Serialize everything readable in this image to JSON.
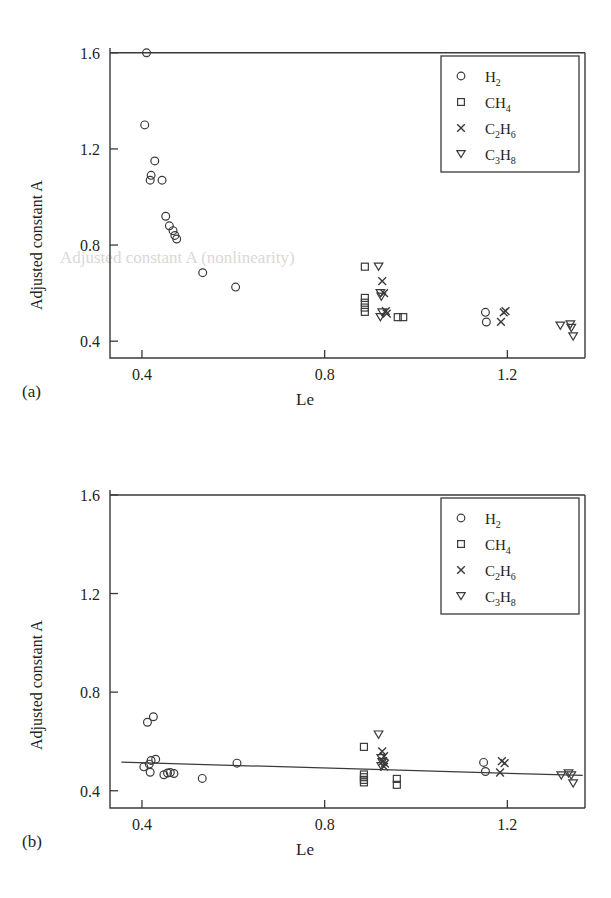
{
  "figure": {
    "panels": [
      {
        "tag": "(a)",
        "xlabel": "Le",
        "ylabel": "Adjusted constant A",
        "xticks": [
          "0.4",
          "0.8",
          "1.2"
        ],
        "yticks": [
          "1.6",
          "1.2",
          "0.8",
          "0.4"
        ]
      },
      {
        "tag": "(b)",
        "xlabel": "Le",
        "ylabel": "Adjusted constant A",
        "xticks": [
          "0.4",
          "0.8",
          "1.2"
        ],
        "yticks": [
          "1.6",
          "1.2",
          "0.8",
          "0.4"
        ]
      }
    ],
    "legend": [
      {
        "marker": "circle-marker",
        "base": "H",
        "sub1": "",
        "mid": "",
        "sub2": "2"
      },
      {
        "marker": "square-marker",
        "base": "CH",
        "sub1": "",
        "mid": "",
        "sub2": "4"
      },
      {
        "marker": "cross-marker",
        "base": "C",
        "sub1": "2",
        "mid": "H",
        "sub2": "6"
      },
      {
        "marker": "triangle-marker",
        "base": "C",
        "sub1": "3",
        "mid": "H",
        "sub2": "8"
      }
    ],
    "colors": {
      "ink": "#231f20",
      "axis": "#3a3a3a",
      "marker": "#3a3a3a",
      "background": "#ffffff"
    },
    "bleed_text": "Adjusted constant A (nonlinearity)"
  },
  "chart_data": [
    {
      "type": "scatter",
      "title": "",
      "panel": "(a)",
      "xlabel": "Le",
      "ylabel": "Adjusted constant A",
      "xlim": [
        0.33,
        1.37
      ],
      "ylim": [
        0.33,
        1.62
      ],
      "xticks": [
        0.4,
        0.8,
        1.2
      ],
      "yticks": [
        0.4,
        0.8,
        1.2,
        1.6
      ],
      "grid": false,
      "legend_position": "top-right",
      "series": [
        {
          "name": "H2",
          "marker": "circle",
          "points": [
            [
              0.41,
              1.6
            ],
            [
              0.406,
              1.3
            ],
            [
              0.428,
              1.15
            ],
            [
              0.42,
              1.09
            ],
            [
              0.418,
              1.07
            ],
            [
              0.444,
              1.07
            ],
            [
              0.452,
              0.92
            ],
            [
              0.46,
              0.88
            ],
            [
              0.468,
              0.86
            ],
            [
              0.472,
              0.84
            ],
            [
              0.476,
              0.825
            ],
            [
              0.533,
              0.685
            ],
            [
              0.605,
              0.625
            ],
            [
              1.152,
              0.52
            ],
            [
              1.154,
              0.48
            ]
          ]
        },
        {
          "name": "CH4",
          "marker": "square",
          "points": [
            [
              0.888,
              0.71
            ],
            [
              0.888,
              0.58
            ],
            [
              0.888,
              0.56
            ],
            [
              0.888,
              0.54
            ],
            [
              0.888,
              0.522
            ],
            [
              0.96,
              0.5
            ],
            [
              0.972,
              0.5
            ]
          ]
        },
        {
          "name": "C2H6",
          "marker": "cross",
          "points": [
            [
              0.926,
              0.65
            ],
            [
              0.93,
              0.6
            ],
            [
              0.934,
              0.525
            ],
            [
              0.936,
              0.515
            ],
            [
              1.196,
              0.525
            ],
            [
              1.192,
              0.52
            ],
            [
              1.186,
              0.48
            ]
          ]
        },
        {
          "name": "C3H8",
          "marker": "triangle-down",
          "points": [
            [
              0.918,
              0.71
            ],
            [
              0.922,
              0.6
            ],
            [
              0.924,
              0.585
            ],
            [
              0.926,
              0.52
            ],
            [
              0.922,
              0.5
            ],
            [
              1.316,
              0.465
            ],
            [
              1.338,
              0.47
            ],
            [
              1.34,
              0.455
            ],
            [
              1.344,
              0.42
            ]
          ]
        }
      ]
    },
    {
      "type": "scatter",
      "title": "",
      "panel": "(b)",
      "xlabel": "Le",
      "ylabel": "Adjusted constant A",
      "xlim": [
        0.33,
        1.37
      ],
      "ylim": [
        0.33,
        1.62
      ],
      "xticks": [
        0.4,
        0.8,
        1.2
      ],
      "yticks": [
        0.4,
        0.8,
        1.2,
        1.6
      ],
      "grid": false,
      "legend_position": "top-right",
      "trendline": {
        "x": [
          0.355,
          1.365
        ],
        "y": [
          0.516,
          0.462
        ]
      },
      "series": [
        {
          "name": "H2",
          "marker": "circle",
          "points": [
            [
              0.412,
              0.678
            ],
            [
              0.425,
              0.7
            ],
            [
              0.404,
              0.497
            ],
            [
              0.416,
              0.508
            ],
            [
              0.42,
              0.523
            ],
            [
              0.43,
              0.528
            ],
            [
              0.418,
              0.475
            ],
            [
              0.448,
              0.465
            ],
            [
              0.456,
              0.472
            ],
            [
              0.462,
              0.474
            ],
            [
              0.47,
              0.47
            ],
            [
              0.532,
              0.45
            ],
            [
              0.608,
              0.512
            ],
            [
              1.148,
              0.515
            ],
            [
              1.152,
              0.478
            ]
          ]
        },
        {
          "name": "CH4",
          "marker": "square",
          "points": [
            [
              0.886,
              0.578
            ],
            [
              0.886,
              0.466
            ],
            [
              0.886,
              0.455
            ],
            [
              0.886,
              0.444
            ],
            [
              0.886,
              0.434
            ],
            [
              0.958,
              0.448
            ],
            [
              0.958,
              0.424
            ]
          ]
        },
        {
          "name": "C2H6",
          "marker": "cross",
          "points": [
            [
              0.926,
              0.56
            ],
            [
              0.93,
              0.54
            ],
            [
              0.928,
              0.52
            ],
            [
              0.932,
              0.51
            ],
            [
              0.93,
              0.498
            ],
            [
              1.188,
              0.52
            ],
            [
              1.194,
              0.512
            ],
            [
              1.184,
              0.474
            ]
          ]
        },
        {
          "name": "C3H8",
          "marker": "triangle-down",
          "points": [
            [
              0.918,
              0.628
            ],
            [
              0.924,
              0.532
            ],
            [
              0.926,
              0.516
            ],
            [
              0.924,
              0.5
            ],
            [
              1.318,
              0.462
            ],
            [
              1.334,
              0.47
            ],
            [
              1.34,
              0.462
            ],
            [
              1.344,
              0.43
            ]
          ]
        }
      ]
    }
  ]
}
